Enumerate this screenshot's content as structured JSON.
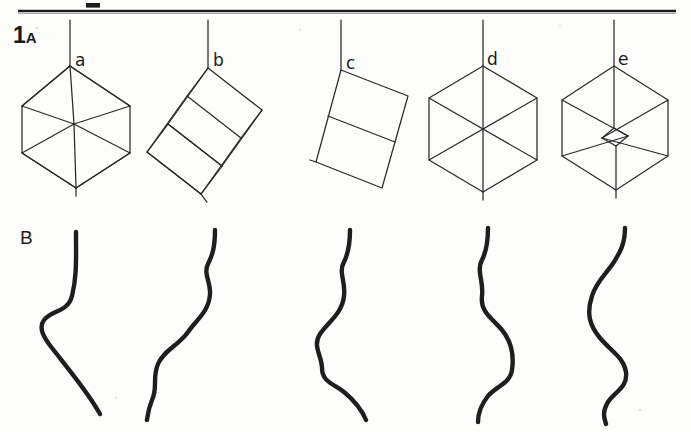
{
  "figure": {
    "number": "1",
    "panel_a_label": "A",
    "panel_b_label": "B",
    "caption_number_full": "1A",
    "background_color": "#fdfdfb",
    "ink_color": "#1e1e1e"
  },
  "top_rule": {
    "name": "horizontal-rule",
    "y": 11,
    "x_start": 18,
    "x_end": 676,
    "thickness": 2.2,
    "tick_mark": {
      "x": 86,
      "y": 4,
      "width": 14,
      "height": 4
    }
  },
  "panel_a": {
    "label": "A",
    "title": "hanging cube orientations",
    "items": [
      {
        "letter": "a",
        "label_x": 75,
        "label_y": 57,
        "string": {
          "x1": 70,
          "y1": 20,
          "x2": 70,
          "y2": 66
        },
        "description": "cube viewed near body-diagonal, hexagonal silhouette with internal vertex",
        "type": "hex-vertex-cube",
        "cx": 76,
        "cy": 124,
        "rx": 58,
        "ry": 60,
        "tilt": 0
      },
      {
        "letter": "b",
        "label_x": 215,
        "label_y": 58,
        "string": {
          "x1": 208,
          "y1": 20,
          "x2": 208,
          "y2": 68
        },
        "description": "cube tilted, oblique face-on wireframe",
        "type": "tilted-cube",
        "cx": 212,
        "cy": 128,
        "size": 56,
        "tilt": -32
      },
      {
        "letter": "c",
        "label_x": 348,
        "label_y": 60,
        "string": {
          "x1": 341,
          "y1": 20,
          "x2": 341,
          "y2": 70
        },
        "description": "cube viewed edge-on, appears as rectangle split by one edge",
        "type": "edge-on-cube",
        "cx": 345,
        "cy": 130,
        "w": 92,
        "h": 108,
        "tilt": -14
      },
      {
        "letter": "d",
        "label_x": 489,
        "label_y": 57,
        "string": {
          "x1": 483,
          "y1": 20,
          "x2": 483,
          "y2": 66
        },
        "description": "cube viewed exactly down body diagonal, perfect hexagon with three spokes",
        "type": "hexagon-cube",
        "cx": 489,
        "cy": 127,
        "r": 62,
        "tilt": 0
      },
      {
        "letter": "e",
        "label_x": 620,
        "label_y": 57,
        "string": {
          "x1": 614,
          "y1": 20,
          "x2": 614,
          "y2": 66
        },
        "description": "cube near body-diagonal view with small central diamond",
        "type": "hex-diamond-cube",
        "cx": 620,
        "cy": 126,
        "rx": 58,
        "ry": 60,
        "tilt": 0
      }
    ]
  },
  "panel_b": {
    "label": "B",
    "title": "corresponding motion traces",
    "items": [
      {
        "letter": "a",
        "description": "straight top, single leftward bulge then long diagonal down-right"
      },
      {
        "letter": "b",
        "description": "gentle repeating S-wave drifting left"
      },
      {
        "letter": "c",
        "description": "S-wave with broad left bulge in middle"
      },
      {
        "letter": "d",
        "description": "pronounced S with rightward bulge then hook left at bottom"
      },
      {
        "letter": "e",
        "description": "double-wave, large left bulge then right bulge"
      }
    ]
  }
}
